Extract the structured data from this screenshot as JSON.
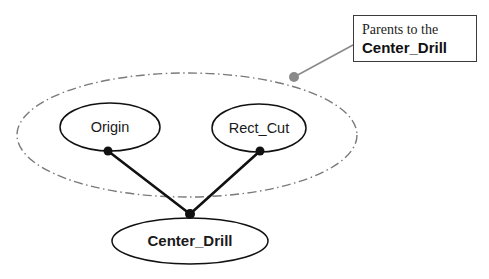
{
  "diagram": {
    "type": "feature-tree-parent-child",
    "outer_group": {
      "name": "parents-group-ellipse",
      "style": "dash-dot",
      "stroke": "#7a7a7a",
      "cx": 187,
      "cy": 135,
      "rx": 170,
      "ry": 62
    },
    "nodes": [
      {
        "id": "origin",
        "label": "Origin",
        "bold": false,
        "cx": 110,
        "cy": 127,
        "rx": 50,
        "ry": 24,
        "port": {
          "x": 108,
          "y": 151
        }
      },
      {
        "id": "rect_cut",
        "label": "Rect_Cut",
        "bold": false,
        "cx": 259,
        "cy": 128,
        "rx": 47,
        "ry": 24,
        "port": {
          "x": 260,
          "y": 151
        }
      },
      {
        "id": "center_drill",
        "label": "Center_Drill",
        "bold": true,
        "cx": 190,
        "cy": 241,
        "rx": 78,
        "ry": 23,
        "port": {
          "x": 190,
          "y": 214
        }
      }
    ],
    "edges": [
      {
        "from": "origin",
        "to": "center_drill",
        "stroke": "#111111",
        "width": 2.6
      },
      {
        "from": "rect_cut",
        "to": "center_drill",
        "stroke": "#111111",
        "width": 2.6
      }
    ],
    "connector_dots": [
      {
        "name": "origin-port-dot",
        "x": 108,
        "y": 151,
        "r": 4.5,
        "fill": "#111111"
      },
      {
        "name": "rect-cut-port-dot",
        "x": 260,
        "y": 151,
        "r": 4.5,
        "fill": "#111111"
      },
      {
        "name": "center-drill-junction-dot",
        "x": 190,
        "y": 214,
        "r": 5,
        "fill": "#111111"
      },
      {
        "name": "callout-anchor-dot",
        "x": 294,
        "y": 77,
        "r": 5,
        "fill": "#8a8a8a"
      }
    ],
    "callout": {
      "name": "parents-callout",
      "line1": "Parents to the",
      "line2": "Center_Drill",
      "leader": {
        "stroke": "#8a8a8a",
        "width": 1.6,
        "from": {
          "x": 353,
          "y": 45
        },
        "to": {
          "x": 294,
          "y": 77
        }
      }
    }
  },
  "colors": {
    "node_stroke": "#111111",
    "group_stroke": "#7a7a7a",
    "edge": "#111111",
    "callout_border": "#3b3b3b",
    "leader": "#8a8a8a",
    "background": "#ffffff"
  }
}
